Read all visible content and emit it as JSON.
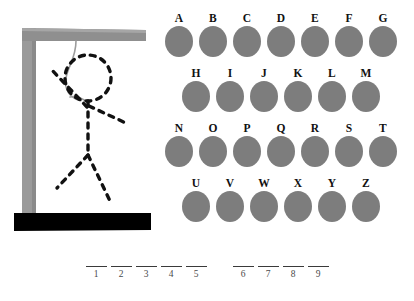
{
  "game": {
    "title": "Hangman",
    "background_color": "#ffffff"
  },
  "gallows": {
    "post_color": "#9a9a9a",
    "beam_color": "#8f8f8f",
    "base_color": "#000000",
    "rope_color": "#9c9c9c",
    "figure_color": "#111111",
    "figure_style": "dashed",
    "parts_drawn": [
      "head",
      "torso",
      "left-arm",
      "right-arm",
      "left-leg",
      "right-leg"
    ],
    "wrong_guesses": 6
  },
  "alphabet": {
    "disc_color": "#7d7d7d",
    "rows": [
      {
        "indented": false,
        "letters": [
          "A",
          "B",
          "C",
          "D",
          "E",
          "F",
          "G"
        ]
      },
      {
        "indented": true,
        "letters": [
          "H",
          "I",
          "J",
          "K",
          "L",
          "M"
        ]
      },
      {
        "indented": false,
        "letters": [
          "N",
          "O",
          "P",
          "Q",
          "R",
          "S",
          "T"
        ]
      },
      {
        "indented": true,
        "letters": [
          "U",
          "V",
          "W",
          "X",
          "Y",
          "Z"
        ]
      }
    ]
  },
  "word": {
    "groups": [
      {
        "slots": [
          {
            "number": "1",
            "letter": ""
          },
          {
            "number": "2",
            "letter": ""
          },
          {
            "number": "3",
            "letter": ""
          },
          {
            "number": "4",
            "letter": ""
          },
          {
            "number": "5",
            "letter": ""
          }
        ]
      },
      {
        "slots": [
          {
            "number": "6",
            "letter": ""
          },
          {
            "number": "7",
            "letter": ""
          },
          {
            "number": "8",
            "letter": ""
          },
          {
            "number": "9",
            "letter": ""
          }
        ]
      }
    ]
  }
}
